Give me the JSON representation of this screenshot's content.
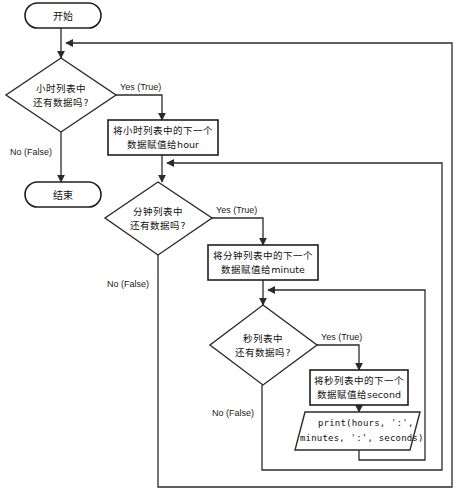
{
  "diagram": {
    "type": "flowchart",
    "language": "zh-CN",
    "title": "",
    "background_color": "#ffffff",
    "line_color": "#2b2b2b",
    "text_color": "#111111"
  },
  "nodes": {
    "start": {
      "shape": "terminator",
      "label": "开始"
    },
    "end": {
      "shape": "terminator",
      "label": "结束"
    },
    "hour_decision": {
      "shape": "decision",
      "line1": "小时列表中",
      "line2": "还有数据吗?"
    },
    "hour_process": {
      "shape": "process",
      "line1": "将小时列表中的下一个",
      "line2": "数据赋值给hour"
    },
    "minute_decision": {
      "shape": "decision",
      "line1": "分钟列表中",
      "line2": "还有数据吗?"
    },
    "minute_process": {
      "shape": "process",
      "line1": "将分钟列表中的下一个",
      "line2": "数据赋值给minute"
    },
    "second_decision": {
      "shape": "decision",
      "line1": "秒列表中",
      "line2": "还有数据吗?"
    },
    "second_process": {
      "shape": "process",
      "line1": "将秒列表中的下一个",
      "line2": "数据赋值给second"
    },
    "print_output": {
      "shape": "parallelogram",
      "line1": "print(hours, ':',",
      "line2": "minutes, ':', seconds)"
    }
  },
  "edge_labels": {
    "hour_yes": "Yes (True)",
    "hour_no": "No (False)",
    "minute_yes": "Yes (True)",
    "minute_no": "No (False)",
    "second_yes": "Yes (True)",
    "second_no": "No (False)"
  }
}
